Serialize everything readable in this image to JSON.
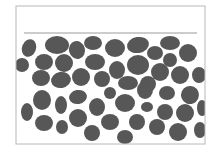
{
  "diagram": {
    "title": "",
    "colors": {
      "background": "#ffffff",
      "frame": "#b8b8b8",
      "level_line": "#9a9a9a",
      "particle": "#575757"
    },
    "frame": {
      "x": 16,
      "y": 6,
      "width": 189,
      "height": 138
    },
    "level_line": {
      "x1": 24,
      "y1": 33,
      "x2": 197,
      "y2": 33
    },
    "particles": [
      {
        "cx": 29,
        "cy": 48,
        "rx": 7,
        "ry": 9,
        "rot": 20
      },
      {
        "cx": 57,
        "cy": 45,
        "rx": 12,
        "ry": 9,
        "rot": 0
      },
      {
        "cx": 77,
        "cy": 50,
        "rx": 8,
        "ry": 9,
        "rot": -15
      },
      {
        "cx": 93,
        "cy": 43,
        "rx": 9,
        "ry": 7,
        "rot": 0
      },
      {
        "cx": 115,
        "cy": 48,
        "rx": 10,
        "ry": 9,
        "rot": 0
      },
      {
        "cx": 138,
        "cy": 45,
        "rx": 11,
        "ry": 8,
        "rot": -10
      },
      {
        "cx": 155,
        "cy": 53,
        "rx": 8,
        "ry": 7,
        "rot": 0
      },
      {
        "cx": 170,
        "cy": 43,
        "rx": 10,
        "ry": 7,
        "rot": 0
      },
      {
        "cx": 188,
        "cy": 53,
        "rx": 9,
        "ry": 9,
        "rot": 0
      },
      {
        "cx": 22,
        "cy": 65,
        "rx": 7,
        "ry": 7,
        "rot": 0
      },
      {
        "cx": 44,
        "cy": 62,
        "rx": 9,
        "ry": 8,
        "rot": 0
      },
      {
        "cx": 64,
        "cy": 63,
        "rx": 9,
        "ry": 9,
        "rot": 0
      },
      {
        "cx": 95,
        "cy": 62,
        "rx": 10,
        "ry": 8,
        "rot": 0
      },
      {
        "cx": 117,
        "cy": 70,
        "rx": 8,
        "ry": 9,
        "rot": 0
      },
      {
        "cx": 138,
        "cy": 65,
        "rx": 11,
        "ry": 10,
        "rot": 0
      },
      {
        "cx": 170,
        "cy": 60,
        "rx": 7,
        "ry": 7,
        "rot": 0
      },
      {
        "cx": 160,
        "cy": 72,
        "rx": 9,
        "ry": 9,
        "rot": 0
      },
      {
        "cx": 180,
        "cy": 75,
        "rx": 9,
        "ry": 9,
        "rot": 0
      },
      {
        "cx": 199,
        "cy": 75,
        "rx": 7,
        "ry": 8,
        "rot": 0
      },
      {
        "cx": 41,
        "cy": 78,
        "rx": 9,
        "ry": 8,
        "rot": 0
      },
      {
        "cx": 61,
        "cy": 80,
        "rx": 10,
        "ry": 8,
        "rot": -10
      },
      {
        "cx": 81,
        "cy": 77,
        "rx": 9,
        "ry": 9,
        "rot": 0
      },
      {
        "cx": 102,
        "cy": 79,
        "rx": 8,
        "ry": 8,
        "rot": 0
      },
      {
        "cx": 128,
        "cy": 83,
        "rx": 10,
        "ry": 7,
        "rot": 0
      },
      {
        "cx": 148,
        "cy": 84,
        "rx": 8,
        "ry": 8,
        "rot": 0
      },
      {
        "cx": 42,
        "cy": 100,
        "rx": 9,
        "ry": 10,
        "rot": 0
      },
      {
        "cx": 61,
        "cy": 105,
        "rx": 6,
        "ry": 9,
        "rot": 0
      },
      {
        "cx": 78,
        "cy": 97,
        "rx": 9,
        "ry": 7,
        "rot": -10
      },
      {
        "cx": 97,
        "cy": 107,
        "rx": 8,
        "ry": 9,
        "rot": 0
      },
      {
        "cx": 110,
        "cy": 93,
        "rx": 6,
        "ry": 6,
        "rot": 0
      },
      {
        "cx": 125,
        "cy": 103,
        "rx": 10,
        "ry": 9,
        "rot": 0
      },
      {
        "cx": 145,
        "cy": 90,
        "rx": 8,
        "ry": 9,
        "rot": 0
      },
      {
        "cx": 167,
        "cy": 93,
        "rx": 8,
        "ry": 7,
        "rot": 0
      },
      {
        "cx": 190,
        "cy": 95,
        "rx": 9,
        "ry": 9,
        "rot": -20
      },
      {
        "cx": 147,
        "cy": 107,
        "rx": 6,
        "ry": 5,
        "rot": 0
      },
      {
        "cx": 165,
        "cy": 112,
        "rx": 8,
        "ry": 8,
        "rot": 0
      },
      {
        "cx": 185,
        "cy": 113,
        "rx": 9,
        "ry": 9,
        "rot": 0
      },
      {
        "cx": 202,
        "cy": 108,
        "rx": 5,
        "ry": 8,
        "rot": 0
      },
      {
        "cx": 27,
        "cy": 112,
        "rx": 6,
        "ry": 9,
        "rot": 0
      },
      {
        "cx": 44,
        "cy": 123,
        "rx": 9,
        "ry": 8,
        "rot": 0
      },
      {
        "cx": 62,
        "cy": 127,
        "rx": 6,
        "ry": 7,
        "rot": 0
      },
      {
        "cx": 78,
        "cy": 118,
        "rx": 9,
        "ry": 9,
        "rot": 0
      },
      {
        "cx": 110,
        "cy": 122,
        "rx": 9,
        "ry": 8,
        "rot": 0
      },
      {
        "cx": 92,
        "cy": 133,
        "rx": 8,
        "ry": 8,
        "rot": 0
      },
      {
        "cx": 125,
        "cy": 137,
        "rx": 8,
        "ry": 7,
        "rot": 0
      },
      {
        "cx": 137,
        "cy": 122,
        "rx": 8,
        "ry": 8,
        "rot": 0
      },
      {
        "cx": 157,
        "cy": 127,
        "rx": 8,
        "ry": 8,
        "rot": 0
      },
      {
        "cx": 178,
        "cy": 132,
        "rx": 9,
        "ry": 9,
        "rot": 0
      },
      {
        "cx": 200,
        "cy": 130,
        "rx": 6,
        "ry": 8,
        "rot": 0
      }
    ]
  }
}
